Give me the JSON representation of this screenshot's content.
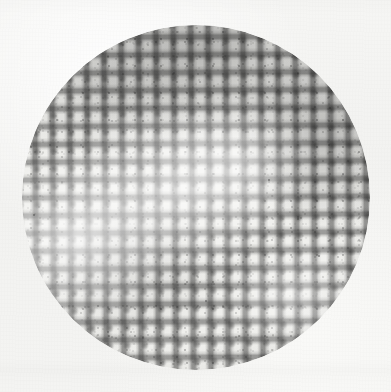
{
  "figure": {
    "caption": "",
    "medium": "grayscale photographic scan",
    "pattern": "plaid / checkered grid weave"
  },
  "canvas": {
    "width_px": 391,
    "height_px": 392,
    "background_color": "#f2f2f0",
    "paper_tone": "#f6f6f4"
  },
  "specimen": {
    "shape": "circle",
    "center_x_px": 196,
    "center_y_px": 197,
    "diameter_px": 348,
    "left_px": 22,
    "top_px": 25,
    "width_px": 348,
    "height_px": 345,
    "base_color": "#efefec",
    "edge_softness": "feathered"
  },
  "weave": {
    "warp_spacing_px": 17.4,
    "weft_spacing_px": 17.8,
    "warp_line_width_px": 3.2,
    "weft_line_width_px": 3.2,
    "rotation_deg": -1.1,
    "line_color": "#3b3b3b",
    "intersection_color": "#2d2d2d",
    "approx_warp_count": 19,
    "approx_weft_count": 19,
    "texture": "granular / toner speckle"
  },
  "tones": {
    "darkest_gray": "#6e6e6e",
    "mid_gray": "#a8a8a6",
    "light_gray": "#dcdcda",
    "highlight": "#fbfbf9"
  },
  "density_map": {
    "description": "Relative ink density of the weave across the disc",
    "regions": [
      {
        "name": "top-center",
        "x_pct": 52,
        "y_pct": 6,
        "density": "high"
      },
      {
        "name": "upper-right",
        "x_pct": 88,
        "y_pct": 30,
        "density": "high"
      },
      {
        "name": "upper-left",
        "x_pct": 22,
        "y_pct": 18,
        "density": "medium"
      },
      {
        "name": "center",
        "x_pct": 44,
        "y_pct": 48,
        "density": "low"
      },
      {
        "name": "lower-left",
        "x_pct": 16,
        "y_pct": 62,
        "density": "very low"
      },
      {
        "name": "lower-center",
        "x_pct": 30,
        "y_pct": 72,
        "density": "medium"
      },
      {
        "name": "lower-right",
        "x_pct": 78,
        "y_pct": 78,
        "density": "low"
      }
    ]
  },
  "flecks": [
    {
      "x_px": 33,
      "y_px": 214,
      "size_px": 2
    },
    {
      "x_px": 268,
      "y_px": 179,
      "size_px": 2
    },
    {
      "x_px": 120,
      "y_px": 86,
      "size_px": 2
    },
    {
      "x_px": 318,
      "y_px": 255,
      "size_px": 2
    },
    {
      "x_px": 205,
      "y_px": 300,
      "size_px": 2
    }
  ]
}
